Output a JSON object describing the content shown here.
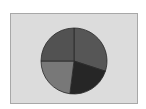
{
  "chart_data": {
    "type": "pie",
    "title": "",
    "legend": null,
    "start_angle_deg": 0,
    "direction": "clockwise",
    "slices": [
      {
        "label": "",
        "value": 30,
        "color": "#565656"
      },
      {
        "label": "",
        "value": 22,
        "color": "#262626"
      },
      {
        "label": "",
        "value": 23,
        "color": "#787878"
      },
      {
        "label": "",
        "value": 25,
        "color": "#525252"
      }
    ],
    "background": "#dcdcdc",
    "stroke": "#2a2a2a"
  }
}
